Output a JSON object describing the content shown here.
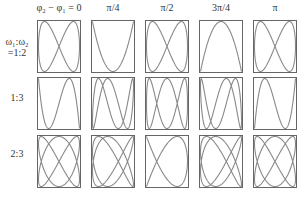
{
  "column_headers": [
    "φ₂ − φ₁ = 0",
    "π/4",
    "π/2",
    "3π/4",
    "π"
  ],
  "phase_values": [
    0,
    0.7853981634,
    1.5707963268,
    2.3561944902,
    3.1415926536
  ],
  "row_labels": [
    {
      "line1": "ω₁:ω₂",
      "line2": "=1:2"
    },
    {
      "line1": "",
      "line2": "1:3"
    },
    {
      "line1": "",
      "line2": "2:3"
    }
  ],
  "ratios": [
    [
      1,
      2
    ],
    [
      1,
      3
    ],
    [
      2,
      3
    ]
  ],
  "colors": {
    "curve": "#888888",
    "frame": "#666666"
  }
}
